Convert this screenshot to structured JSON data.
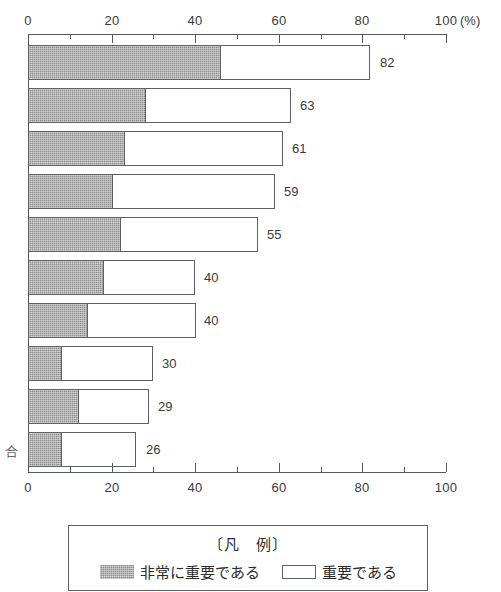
{
  "chart_data": {
    "type": "bar",
    "orientation": "horizontal",
    "stacked": true,
    "title": "",
    "subtitle": "",
    "xlabel": "",
    "ylabel": "",
    "unit_label": "(%)",
    "xlim": [
      0,
      100
    ],
    "grid": false,
    "axis_positions": [
      "top",
      "bottom"
    ],
    "tick_labels_major": [
      "0",
      "20",
      "40",
      "60",
      "80",
      "100"
    ],
    "tick_values_major": [
      0,
      20,
      40,
      60,
      80,
      100
    ],
    "tick_values_minor": [
      10,
      30,
      50,
      70,
      90
    ],
    "legend_position": "bottom",
    "legend_title": "〔凡　例〕",
    "categories": [
      "",
      "",
      "",
      "",
      "",
      "",
      "",
      "",
      "",
      "合"
    ],
    "series": [
      {
        "name": "非常に重要である",
        "swatch": "dark-hatched",
        "color": "#8c8c8c",
        "values": [
          46,
          28,
          23,
          20,
          22,
          18,
          14,
          8,
          12,
          8
        ]
      },
      {
        "name": "重要である",
        "swatch": "white",
        "color": "#ffffff",
        "values": [
          36,
          35,
          38,
          39,
          33,
          22,
          26,
          22,
          17,
          18
        ]
      }
    ],
    "totals": [
      82,
      63,
      61,
      59,
      55,
      40,
      40,
      30,
      29,
      26
    ],
    "total_labels": [
      "82",
      "63",
      "61",
      "59",
      "55",
      "40",
      "40",
      "30",
      "29",
      "26"
    ]
  },
  "axis": {
    "top": {
      "labels": [
        "0",
        "20",
        "40",
        "60",
        "80",
        "100"
      ],
      "unit": "(%)"
    },
    "bottom": {
      "labels": [
        "0",
        "20",
        "40",
        "60",
        "80",
        "100"
      ]
    }
  },
  "legend": {
    "title": "〔凡　例〕",
    "entries": [
      {
        "label": "非常に重要である",
        "swatch": "dark"
      },
      {
        "label": "重要である",
        "swatch": "light"
      }
    ]
  },
  "category_labels": [
    {
      "text": ""
    },
    {
      "text": ""
    },
    {
      "text": ""
    },
    {
      "text": ""
    },
    {
      "text": ""
    },
    {
      "text": ""
    },
    {
      "text": ""
    },
    {
      "text": ""
    },
    {
      "text": ""
    },
    {
      "text": "合"
    }
  ]
}
